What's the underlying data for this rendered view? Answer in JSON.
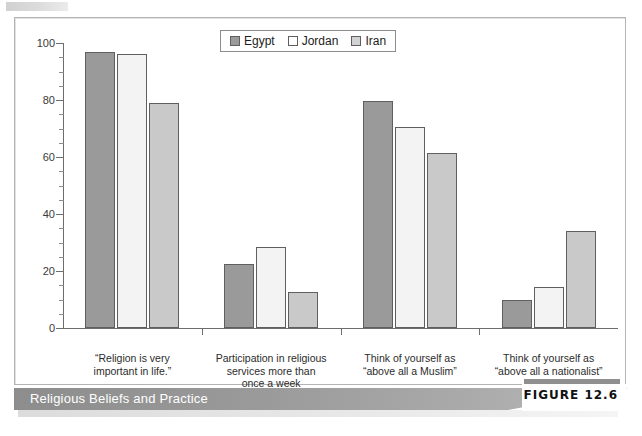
{
  "figure": {
    "caption": "Religious Beliefs and Practice",
    "number_label": "FIGURE 12.6"
  },
  "chart_data": {
    "type": "bar",
    "title": "",
    "xlabel": "",
    "ylabel": "",
    "ylim": [
      0,
      100
    ],
    "yticks": [
      0,
      20,
      40,
      60,
      80,
      100
    ],
    "ytick_labels": [
      "0",
      "20",
      "40",
      "60",
      "80",
      "100"
    ],
    "grid": false,
    "legend_position": "top-center",
    "categories": [
      "“Religion is very important in life.”",
      "Participation in religious services more than once a week",
      "Think of yourself as “above all a Muslim”",
      "Think of yourself as “above all a nationalist”"
    ],
    "category_lines": [
      [
        "“Religion is very",
        "important in life.”"
      ],
      [
        "Participation in religious",
        "services more than",
        "once a week"
      ],
      [
        "Think of yourself as",
        "“above all a Muslim”"
      ],
      [
        "Think of yourself as",
        "“above all a nationalist”"
      ]
    ],
    "series": [
      {
        "name": "Egypt",
        "color": "#9a9a9a",
        "values": [
          97,
          22.5,
          79.5,
          10
        ]
      },
      {
        "name": "Jordan",
        "color": "#f3f3f3",
        "values": [
          96,
          28.5,
          70.5,
          14.5
        ]
      },
      {
        "name": "Iran",
        "color": "#c9c9c9",
        "values": [
          79,
          12.5,
          61.5,
          34
        ]
      }
    ]
  }
}
